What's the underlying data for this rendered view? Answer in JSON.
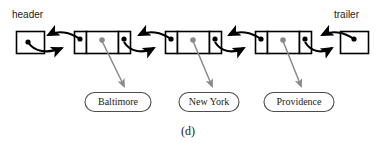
{
  "figure": {
    "caption": "(d)",
    "type": "doubly-linked-list",
    "head_label": "header",
    "tail_label": "trailer",
    "colors": {
      "stroke": "#000000",
      "fill": "#ffffff",
      "element_link": "#808080",
      "text": "#1a1a1a"
    }
  },
  "sentinels": {
    "header": {
      "label": "header",
      "x": 16,
      "y": 31,
      "w": 28,
      "h": 22
    },
    "trailer": {
      "label": "trailer",
      "x": 340,
      "y": 31,
      "w": 28,
      "h": 22
    }
  },
  "nodes": [
    {
      "id": "node-1",
      "element": "Baltimore",
      "x": 74,
      "y": 31,
      "w": 56,
      "h": 22
    },
    {
      "id": "node-2",
      "element": "New York",
      "x": 165,
      "y": 31,
      "w": 56,
      "h": 22
    },
    {
      "id": "node-3",
      "element": "Providence",
      "x": 255,
      "y": 31,
      "w": 56,
      "h": 22
    }
  ],
  "element_labels": [
    {
      "text": "Baltimore",
      "cx": 118,
      "cy": 102,
      "w": 66,
      "h": 19
    },
    {
      "text": "New York",
      "cx": 209,
      "cy": 102,
      "w": 60,
      "h": 19
    },
    {
      "text": "Providence",
      "cx": 299,
      "cy": 102,
      "w": 70,
      "h": 19
    }
  ],
  "links": [
    {
      "from": "header",
      "to": "node-1",
      "kind": "next-prev-pair"
    },
    {
      "from": "node-1",
      "to": "node-2",
      "kind": "next-prev-pair"
    },
    {
      "from": "node-2",
      "to": "node-3",
      "kind": "next-prev-pair"
    },
    {
      "from": "node-3",
      "to": "trailer",
      "kind": "next-prev-pair"
    }
  ]
}
